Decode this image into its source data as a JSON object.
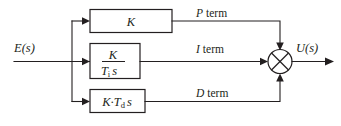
{
  "diagram": {
    "input_signal": "E(s)",
    "output_signal": "U(s)",
    "colors": {
      "line": "#231f20",
      "background": "#ffffff"
    },
    "blocks": [
      {
        "id": "proportional",
        "label_full": "K",
        "numerator": "K",
        "denominator": "",
        "branch_label": "P term",
        "branch_letter": "P",
        "branch_word": "term"
      },
      {
        "id": "integral",
        "label_full": "K / (Tᵢ s)",
        "numerator": "K",
        "denominator_base": "T",
        "denominator_sub": "i",
        "denominator_tail": "s",
        "branch_label": "I term",
        "branch_letter": "I",
        "branch_word": "term"
      },
      {
        "id": "derivative",
        "label_full": "K·Tᵈ s",
        "gain": "K·T",
        "gain_sub": "d",
        "gain_tail": "s",
        "branch_label": "D term",
        "branch_letter": "D",
        "branch_word": "term"
      }
    ],
    "summing_junction": {
      "name": "summing-junction",
      "symbol": "cross-circle",
      "input_count": 3
    }
  }
}
